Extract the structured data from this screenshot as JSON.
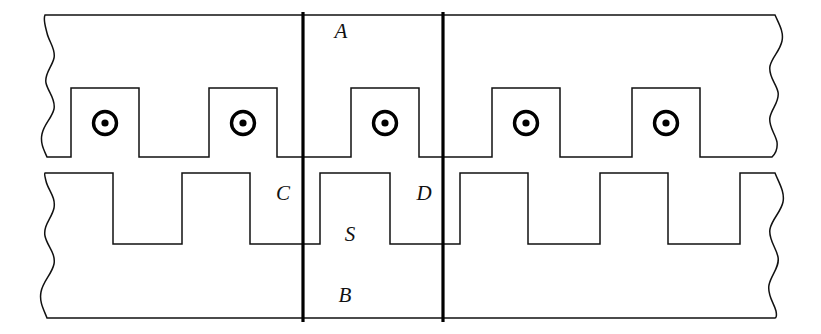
{
  "figure": {
    "background_color": "#ffffff",
    "line_color": "#111111",
    "datum_color": "#000000",
    "width": 821,
    "height": 334
  },
  "labels": [
    {
      "key": "A",
      "text": "A",
      "x": 341,
      "y": 33,
      "role": "primary-core-label"
    },
    {
      "key": "C",
      "text": "C",
      "x": 283,
      "y": 195,
      "role": "gap-left-label"
    },
    {
      "key": "D",
      "text": "D",
      "x": 424,
      "y": 195,
      "role": "gap-right-label"
    },
    {
      "key": "S",
      "text": "S",
      "x": 350,
      "y": 236,
      "role": "secondary-tooth-label"
    },
    {
      "key": "B",
      "text": "B",
      "x": 345,
      "y": 297,
      "role": "secondary-core-label"
    }
  ],
  "datum_lines": [
    {
      "name": "left-datum",
      "x": 303,
      "y1": 12,
      "y2": 322
    },
    {
      "name": "right-datum",
      "x": 443,
      "y1": 12,
      "y2": 322
    }
  ],
  "conductors": [
    {
      "index": 1,
      "x": 105,
      "y": 123,
      "symbol": "current-out-of-page"
    },
    {
      "index": 2,
      "x": 243,
      "y": 123,
      "symbol": "current-out-of-page"
    },
    {
      "index": 3,
      "x": 385,
      "y": 123,
      "symbol": "current-out-of-page"
    },
    {
      "index": 4,
      "x": 526,
      "y": 123,
      "symbol": "current-out-of-page"
    },
    {
      "index": 5,
      "x": 666,
      "y": 123,
      "symbol": "current-out-of-page"
    }
  ],
  "conductor_geometry": {
    "outer_radius": 11.5,
    "dot_radius": 3.6,
    "ring_stroke": 3.4
  },
  "upper_part": {
    "name": "slotted-primary",
    "top_y": 15,
    "bottom_y": 157,
    "slot_top_y": 88,
    "slot_half_width": 34,
    "left_break_x": 45,
    "right_break_x": 775,
    "slot_centers": [
      105,
      243,
      385,
      526,
      666
    ]
  },
  "lower_part": {
    "name": "toothed-secondary",
    "tooth_top_y": 173,
    "valley_y": 244,
    "bottom_y": 318,
    "left_break_x": 45,
    "right_break_x": 775,
    "tooth_spans": [
      [
        45,
        113
      ],
      [
        182,
        250
      ],
      [
        320,
        390
      ],
      [
        460,
        528
      ],
      [
        600,
        668
      ],
      [
        740,
        775
      ]
    ]
  },
  "break_edges": {
    "left_upper": "irregular-wavy-break",
    "right_upper": "irregular-wavy-break",
    "left_lower": "irregular-wavy-break",
    "right_lower": "irregular-wavy-break"
  }
}
